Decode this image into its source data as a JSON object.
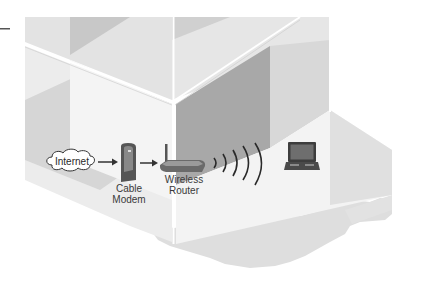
{
  "diagram": {
    "type": "home-wireless-network-illustration",
    "nodes": [
      {
        "id": "internet",
        "label": "Internet",
        "icon": "cloud-icon"
      },
      {
        "id": "modem",
        "label_line1": "Cable",
        "label_line2": "Modem",
        "icon": "cable-modem-icon"
      },
      {
        "id": "router",
        "label_line1": "Wireless",
        "label_line2": "Router",
        "icon": "wireless-router-icon"
      },
      {
        "id": "laptop",
        "label": "",
        "icon": "laptop-icon"
      }
    ],
    "edges": [
      {
        "from": "internet",
        "to": "modem",
        "style": "arrow"
      },
      {
        "from": "modem",
        "to": "router",
        "style": "arrow"
      },
      {
        "from": "router",
        "to": "laptop",
        "style": "wireless-waves"
      }
    ]
  },
  "colors": {
    "background": "#ffffff",
    "wall_light": "#e6e6e6",
    "wall_mid": "#d2d2d2",
    "wall_dark": "#a9a9a9",
    "floor": "#f2f2f2",
    "ground": "#dcdcdc",
    "device": "#555555",
    "text": "#3a3a3a"
  }
}
